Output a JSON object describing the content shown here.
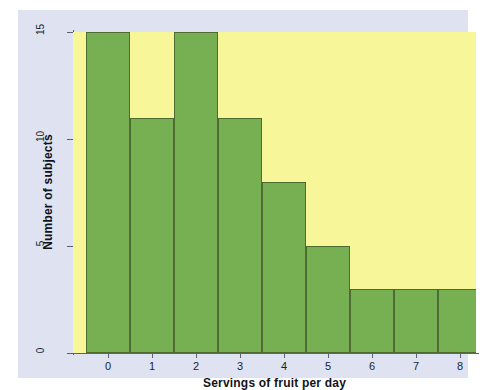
{
  "chart_data": {
    "type": "bar",
    "title": "",
    "subtitle": "",
    "xlabel": "Servings of fruit per day",
    "ylabel": "Number of subjects",
    "categories": [
      "0",
      "1",
      "2",
      "3",
      "4",
      "5",
      "6",
      "7",
      "8"
    ],
    "values": [
      15,
      11,
      15,
      11,
      8,
      5,
      3,
      3,
      3
    ],
    "series": [
      {
        "name": "Number of subjects",
        "values": [
          15,
          11,
          15,
          11,
          8,
          5,
          3,
          3,
          3
        ]
      }
    ],
    "xlim": [
      -0.5,
      8.5
    ],
    "ylim": [
      0,
      15
    ],
    "ytick_labels": [
      "0",
      "5",
      "10",
      "15"
    ],
    "ytick_values": [
      0,
      5,
      10,
      15
    ],
    "xtick_labels": [
      "0",
      "1",
      "2",
      "3",
      "4",
      "5",
      "6",
      "7",
      "8"
    ],
    "grid": false,
    "legend": "none",
    "colors": {
      "bar_fill": "#77b053",
      "bar_edge": "#4e6b34",
      "plot_background": "#f7f79a",
      "figure_background": "#dfe2f0",
      "page_background": "#ffffff",
      "axis_line": "#5b5f70",
      "text": "#11131c"
    }
  }
}
